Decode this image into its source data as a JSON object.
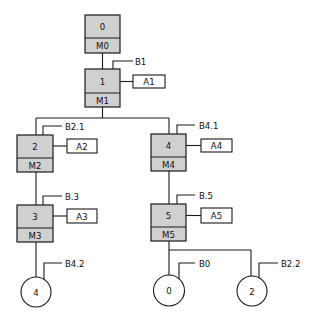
{
  "diagram": {
    "type": "state/step hierarchy diagram",
    "steps": [
      {
        "id": "0",
        "number": "0",
        "marker": "M0"
      },
      {
        "id": "1",
        "number": "1",
        "marker": "M1",
        "condition": "B1",
        "action": "A1"
      },
      {
        "id": "2",
        "number": "2",
        "marker": "M2",
        "condition": "B2.1",
        "action": "A2"
      },
      {
        "id": "3",
        "number": "3",
        "marker": "M3",
        "condition": "B.3",
        "action": "A3"
      },
      {
        "id": "4",
        "number": "4",
        "marker": "M4",
        "condition": "B4.1",
        "action": "A4"
      },
      {
        "id": "5",
        "number": "5",
        "marker": "M5",
        "condition": "B.5",
        "action": "A5"
      }
    ],
    "terminals": [
      {
        "id": "t4",
        "number": "4",
        "condition": "B4.2"
      },
      {
        "id": "t0",
        "number": "0",
        "condition": "B0"
      },
      {
        "id": "t2",
        "number": "2",
        "condition": "B2.2"
      }
    ],
    "edges": [
      [
        "0",
        "1"
      ],
      [
        "1",
        "2"
      ],
      [
        "1",
        "4"
      ],
      [
        "2",
        "3"
      ],
      [
        "3",
        "t4"
      ],
      [
        "4",
        "5"
      ],
      [
        "5",
        "t0"
      ],
      [
        "5",
        "t2"
      ]
    ],
    "colors": {
      "step_fill": "#d0d0d0",
      "stroke": "#1a1a1a",
      "background": "#ffffff"
    }
  }
}
